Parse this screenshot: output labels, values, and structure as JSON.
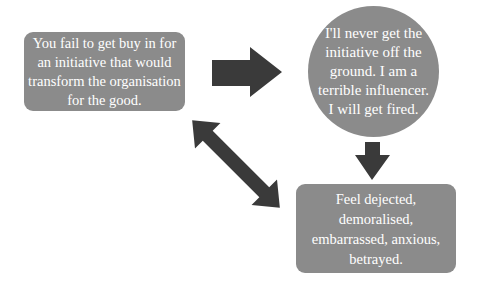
{
  "diagram": {
    "type": "cycle",
    "nodes": [
      {
        "id": "trigger",
        "shape": "rounded-rectangle",
        "text": "You fail to get buy in for an initiative that would transform the organisation for the good."
      },
      {
        "id": "thought",
        "shape": "circle",
        "text": "I'll never get the initiative off the ground. I am a terrible influencer. I will get fired."
      },
      {
        "id": "feeling",
        "shape": "rounded-rectangle",
        "text": "Feel dejected, demoralised, embarrassed, anxious, betrayed."
      }
    ],
    "edges": [
      {
        "from": "trigger",
        "to": "thought",
        "style": "right-arrow"
      },
      {
        "from": "thought",
        "to": "feeling",
        "style": "down-arrow"
      },
      {
        "from": "feeling",
        "to": "trigger",
        "style": "double-arrow"
      }
    ],
    "colors": {
      "node_fill": "#8b8b8b",
      "arrow_fill": "#3a3a3a",
      "text": "#ffffff",
      "background": "#ffffff"
    }
  }
}
